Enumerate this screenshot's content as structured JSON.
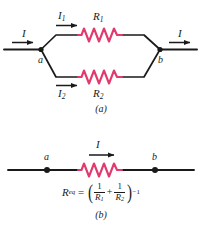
{
  "figure": {
    "colors": {
      "resistor": "#e23a6e",
      "wire": "#1a1a1a",
      "background": "#ffffff"
    },
    "panel_a": {
      "caption": "(a)",
      "current_in_label": "I",
      "current_out_label": "I",
      "branch_top": {
        "current_label": "I",
        "current_sub": "1",
        "resistor_label": "R",
        "resistor_sub": "1"
      },
      "branch_bottom": {
        "current_label": "I",
        "current_sub": "2",
        "resistor_label": "R",
        "resistor_sub": "2"
      },
      "node_left_label": "a",
      "node_right_label": "b"
    },
    "panel_b": {
      "caption": "(b)",
      "current_label": "I",
      "node_left_label": "a",
      "node_right_label": "b",
      "equation": {
        "lhs": "R",
        "lhs_sub": "eq",
        "equals": "=",
        "paren_open": "(",
        "paren_close": ")",
        "term1_num": "1",
        "term1_den": "R",
        "term1_den_sub": "1",
        "operator": "+",
        "term2_num": "1",
        "term2_den": "R",
        "term2_den_sub": "2",
        "exponent": "−1",
        "plain_text": "R_eq = (1/R1 + 1/R2)^-1"
      }
    }
  }
}
